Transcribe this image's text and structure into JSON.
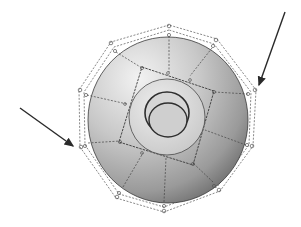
{
  "diagram": {
    "colors": {
      "background": "#ffffff",
      "surface_light": "#e2e2e2",
      "surface_dark": "#6e6e6e",
      "cage": "#444444",
      "arrow": "#2a2a2a"
    },
    "arrows": [
      {
        "name": "left-arrow",
        "from": [
          20,
          108
        ],
        "to": [
          75,
          147
        ]
      },
      {
        "name": "right-arrow",
        "from": [
          285,
          12
        ],
        "to": [
          258,
          87
        ]
      }
    ]
  }
}
